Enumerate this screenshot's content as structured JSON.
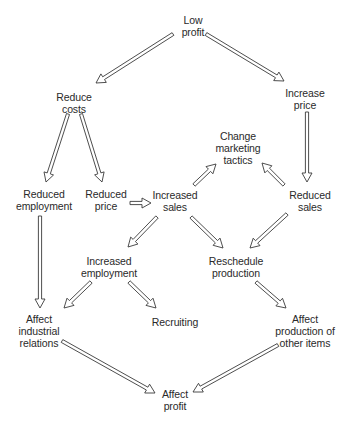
{
  "diagram": {
    "type": "flowchart",
    "nodes": [
      {
        "id": "low_profit",
        "lines": [
          "Low",
          "profit"
        ],
        "x": 193,
        "y": 14
      },
      {
        "id": "reduce_costs",
        "lines": [
          "Reduce",
          "costs"
        ],
        "x": 74,
        "y": 91
      },
      {
        "id": "increase_price",
        "lines": [
          "Increase",
          "price"
        ],
        "x": 305,
        "y": 87
      },
      {
        "id": "change_marketing",
        "lines": [
          "Change",
          "marketing",
          "tactics"
        ],
        "x": 238,
        "y": 130
      },
      {
        "id": "reduced_employment",
        "lines": [
          "Reduced",
          "employment"
        ],
        "x": 44,
        "y": 188
      },
      {
        "id": "reduced_price",
        "lines": [
          "Reduced",
          "price"
        ],
        "x": 106,
        "y": 188
      },
      {
        "id": "increased_sales",
        "lines": [
          "Increased",
          "sales"
        ],
        "x": 175,
        "y": 189
      },
      {
        "id": "reduced_sales",
        "lines": [
          "Reduced",
          "sales"
        ],
        "x": 310,
        "y": 189
      },
      {
        "id": "increased_employment",
        "lines": [
          "Increased",
          "employment"
        ],
        "x": 109,
        "y": 255
      },
      {
        "id": "reschedule_production",
        "lines": [
          "Reschedule",
          "production"
        ],
        "x": 236,
        "y": 255
      },
      {
        "id": "affect_industrial_relations",
        "lines": [
          "Affect",
          "industrial",
          "relations"
        ],
        "x": 39,
        "y": 313
      },
      {
        "id": "recruiting",
        "lines": [
          "Recruiting"
        ],
        "x": 175,
        "y": 316
      },
      {
        "id": "affect_production_other",
        "lines": [
          "Affect",
          "production of",
          "other items"
        ],
        "x": 305,
        "y": 313
      },
      {
        "id": "affect_profit",
        "lines": [
          "Affect",
          "profit"
        ],
        "x": 175,
        "y": 388
      }
    ],
    "edges": [
      {
        "from": "low_profit",
        "to": "reduce_costs",
        "x1": 173,
        "y1": 34,
        "x2": 96,
        "y2": 83
      },
      {
        "from": "low_profit",
        "to": "increase_price",
        "x1": 206,
        "y1": 34,
        "x2": 284,
        "y2": 81
      },
      {
        "from": "reduce_costs",
        "to": "reduced_employment",
        "x1": 68,
        "y1": 114,
        "x2": 46,
        "y2": 182
      },
      {
        "from": "reduce_costs",
        "to": "reduced_price",
        "x1": 81,
        "y1": 114,
        "x2": 102,
        "y2": 182
      },
      {
        "from": "increase_price",
        "to": "reduced_sales",
        "x1": 307,
        "y1": 112,
        "x2": 307,
        "y2": 182
      },
      {
        "from": "reduced_price",
        "to": "increased_sales",
        "x1": 130,
        "y1": 203,
        "x2": 151,
        "y2": 203
      },
      {
        "from": "increased_sales",
        "to": "change_marketing",
        "x1": 194,
        "y1": 185,
        "x2": 216,
        "y2": 164
      },
      {
        "from": "reduced_sales",
        "to": "change_marketing",
        "x1": 284,
        "y1": 185,
        "x2": 262,
        "y2": 163
      },
      {
        "from": "increased_sales",
        "to": "increased_employment",
        "x1": 157,
        "y1": 217,
        "x2": 128,
        "y2": 247
      },
      {
        "from": "increased_sales",
        "to": "reschedule_production",
        "x1": 191,
        "y1": 217,
        "x2": 223,
        "y2": 248
      },
      {
        "from": "reduced_sales",
        "to": "reschedule_production",
        "x1": 287,
        "y1": 214,
        "x2": 250,
        "y2": 248
      },
      {
        "from": "reduced_employment",
        "to": "affect_industrial_relations",
        "x1": 40,
        "y1": 216,
        "x2": 40,
        "y2": 308
      },
      {
        "from": "increased_employment",
        "to": "affect_industrial_relations",
        "x1": 91,
        "y1": 282,
        "x2": 64,
        "y2": 308
      },
      {
        "from": "increased_employment",
        "to": "recruiting",
        "x1": 129,
        "y1": 282,
        "x2": 156,
        "y2": 308
      },
      {
        "from": "reschedule_production",
        "to": "affect_production_other",
        "x1": 256,
        "y1": 282,
        "x2": 286,
        "y2": 308
      },
      {
        "from": "affect_industrial_relations",
        "to": "affect_profit",
        "x1": 62,
        "y1": 341,
        "x2": 155,
        "y2": 393
      },
      {
        "from": "affect_production_other",
        "to": "affect_profit",
        "x1": 278,
        "y1": 345,
        "x2": 193,
        "y2": 392
      }
    ]
  }
}
